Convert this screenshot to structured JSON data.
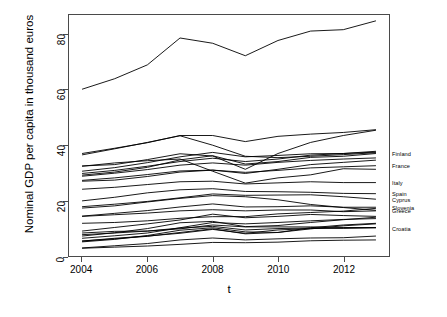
{
  "chart_data": {
    "type": "line",
    "title": "",
    "xlabel": "t",
    "ylabel": "Nominal GDP per capita in thousand euros",
    "xlim": [
      2003.6,
      2013.4
    ],
    "ylim": [
      0,
      87
    ],
    "xticks": [
      2004,
      2006,
      2008,
      2010,
      2012
    ],
    "yticks": [
      0,
      20,
      40,
      60,
      80
    ],
    "xtick_labels": [
      "2004",
      "2006",
      "2008",
      "2010",
      "2012"
    ],
    "ytick_labels": [
      "0",
      "20",
      "40",
      "60",
      "80"
    ],
    "grid": false,
    "legend": "right-edge-labels",
    "x": [
      2004,
      2005,
      2006,
      2007,
      2008,
      2009,
      2010,
      2011,
      2012,
      2013
    ],
    "series": [
      {
        "name": "Luxembourg",
        "label": "",
        "values": [
          60.2,
          64.0,
          69.0,
          78.7,
          76.8,
          72.3,
          77.8,
          81.2,
          81.7,
          84.9
        ]
      },
      {
        "name": "Denmark",
        "label": "",
        "values": [
          37.0,
          38.9,
          40.9,
          43.5,
          43.5,
          41.3,
          43.2,
          44.0,
          44.6,
          45.6
        ]
      },
      {
        "name": "Ireland",
        "label": "",
        "values": [
          36.5,
          38.7,
          41.0,
          43.4,
          40.0,
          36.0,
          35.5,
          36.0,
          36.6,
          37.3
        ]
      },
      {
        "name": "Sweden",
        "label": "",
        "values": [
          32.5,
          33.0,
          34.8,
          36.9,
          36.1,
          31.3,
          37.0,
          41.0,
          43.5,
          45.4
        ]
      },
      {
        "name": "Netherlands",
        "label": "",
        "values": [
          30.6,
          31.9,
          33.7,
          35.8,
          37.4,
          35.8,
          36.3,
          36.9,
          37.0,
          37.5
        ]
      },
      {
        "name": "Austria",
        "label": "",
        "values": [
          29.8,
          30.9,
          32.4,
          34.1,
          35.3,
          34.1,
          35.0,
          36.4,
          37.0,
          37.8
        ]
      },
      {
        "name": "Finland",
        "label": "Finland",
        "values": [
          29.2,
          30.3,
          32.0,
          34.7,
          36.2,
          33.2,
          34.1,
          35.6,
          36.0,
          37.0
        ]
      },
      {
        "name": "Belgium",
        "label": "",
        "values": [
          28.8,
          29.9,
          31.2,
          32.8,
          33.6,
          32.8,
          33.8,
          34.5,
          35.0,
          35.4
        ]
      },
      {
        "name": "Germany",
        "label": "",
        "values": [
          27.0,
          27.4,
          28.7,
          30.3,
          31.0,
          29.8,
          31.3,
          33.0,
          33.8,
          34.6
        ]
      },
      {
        "name": "France",
        "label": "France",
        "values": [
          27.3,
          28.2,
          29.4,
          30.7,
          31.0,
          30.2,
          30.9,
          31.8,
          32.2,
          32.6
        ]
      },
      {
        "name": "United Kingdom",
        "label": "",
        "values": [
          32.4,
          33.6,
          34.4,
          35.0,
          30.6,
          26.3,
          28.2,
          29.3,
          31.5,
          31.3
        ]
      },
      {
        "name": "Italy",
        "label": "Italy",
        "values": [
          24.1,
          24.8,
          25.8,
          26.8,
          27.0,
          26.0,
          26.4,
          26.8,
          26.5,
          26.5
        ]
      },
      {
        "name": "Spain",
        "label": "Spain",
        "values": [
          19.9,
          21.2,
          22.8,
          23.9,
          24.3,
          23.3,
          23.2,
          23.0,
          22.6,
          22.5
        ]
      },
      {
        "name": "Cyprus",
        "label": "Cyprus",
        "values": [
          17.8,
          18.7,
          19.7,
          21.0,
          22.4,
          21.9,
          22.0,
          22.1,
          21.4,
          20.5
        ]
      },
      {
        "name": "Slovenia",
        "label": "Slovenia",
        "values": [
          14.4,
          15.4,
          16.4,
          17.7,
          18.8,
          17.7,
          17.8,
          18.1,
          17.6,
          17.6
        ]
      },
      {
        "name": "Greece",
        "label": "Greece",
        "values": [
          17.3,
          18.1,
          19.5,
          20.8,
          21.8,
          21.4,
          20.3,
          18.6,
          17.5,
          16.5
        ]
      },
      {
        "name": "Portugal",
        "label": "",
        "values": [
          14.3,
          14.9,
          15.5,
          16.3,
          16.7,
          16.3,
          16.6,
          16.6,
          16.0,
          16.3
        ]
      },
      {
        "name": "Malta",
        "label": "",
        "values": [
          11.8,
          12.1,
          12.7,
          13.6,
          14.2,
          14.2,
          15.2,
          15.7,
          16.2,
          17.2
        ]
      },
      {
        "name": "Czech Republic",
        "label": "",
        "values": [
          9.0,
          10.3,
          11.6,
          13.0,
          15.1,
          13.8,
          14.3,
          15.0,
          14.6,
          14.3
        ]
      },
      {
        "name": "Croatia",
        "label": "Croatia",
        "values": [
          7.7,
          8.3,
          9.0,
          9.8,
          11.2,
          10.5,
          10.5,
          10.5,
          10.3,
          10.2
        ]
      },
      {
        "name": "Estonia",
        "label": "",
        "values": [
          7.2,
          8.4,
          9.9,
          12.0,
          12.5,
          10.6,
          11.0,
          12.1,
          13.1,
          14.0
        ]
      },
      {
        "name": "Slovakia",
        "label": "",
        "values": [
          6.4,
          7.3,
          8.3,
          10.2,
          12.1,
          11.6,
          12.1,
          12.7,
          13.2,
          13.5
        ]
      },
      {
        "name": "Hungary",
        "label": "",
        "values": [
          8.3,
          8.9,
          9.0,
          10.1,
          10.7,
          9.4,
          9.9,
          10.1,
          10.0,
          10.2
        ]
      },
      {
        "name": "Poland",
        "label": "",
        "values": [
          5.4,
          6.4,
          7.2,
          8.2,
          9.6,
          8.2,
          9.4,
          9.9,
          10.1,
          10.3
        ]
      },
      {
        "name": "Latvia",
        "label": "",
        "values": [
          5.1,
          6.0,
          7.4,
          9.3,
          10.2,
          8.7,
          8.5,
          9.8,
          10.9,
          11.6
        ]
      },
      {
        "name": "Lithuania",
        "label": "",
        "values": [
          5.4,
          6.2,
          7.1,
          8.5,
          9.8,
          8.0,
          8.5,
          10.2,
          11.2,
          11.8
        ]
      },
      {
        "name": "Romania",
        "label": "",
        "values": [
          2.9,
          3.7,
          4.5,
          5.8,
          6.5,
          5.8,
          6.2,
          6.5,
          6.6,
          7.2
        ]
      },
      {
        "name": "Bulgaria",
        "label": "",
        "values": [
          2.8,
          3.2,
          3.6,
          4.2,
          4.9,
          4.8,
          5.0,
          5.5,
          5.7,
          5.8
        ]
      }
    ]
  },
  "axes": {
    "y_title": "Nominal GDP per capita in thousand euros",
    "x_title": "t"
  },
  "labels": {
    "finland": "Finland",
    "france": "France",
    "italy": "Italy",
    "spain": "Spain",
    "cyprus": "Cyprus",
    "slovenia": "Slovenia",
    "greece": "Greece",
    "croatia": "Croatia"
  },
  "style": {
    "line_color": "#000000",
    "axis_color": "#4a4a4a",
    "background": "#ffffff"
  }
}
